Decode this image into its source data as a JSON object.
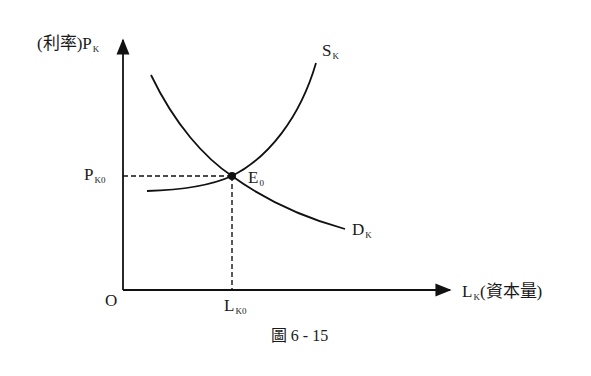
{
  "figure": {
    "caption": "圖 6 - 15",
    "type": "supply-demand diagram"
  },
  "axes": {
    "y": {
      "prefix": "(利率)P",
      "subscript": "K"
    },
    "x": {
      "prefix": "L",
      "subscript": "K",
      "suffix": "(資本量)"
    },
    "origin": "O"
  },
  "curves": {
    "supply": {
      "label": "S",
      "subscript": "K",
      "shape": "upward-sloping, convex"
    },
    "demand": {
      "label": "D",
      "subscript": "K",
      "shape": "downward-sloping, convex"
    }
  },
  "equilibrium": {
    "label": "E",
    "subscript": "0",
    "price_label": "P",
    "price_subscript": "K0",
    "quantity_label": "L",
    "quantity_subscript": "K0"
  },
  "colors": {
    "ink": "#111111",
    "background": "#ffffff"
  }
}
